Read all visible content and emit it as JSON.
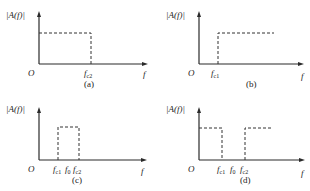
{
  "diagram": {
    "y_axis_label": "|A(f)|",
    "x_axis_label": "f",
    "origin_label": "O",
    "panels": [
      {
        "id": "a",
        "caption": "(a)",
        "type": "low-pass",
        "freq_labels": [
          {
            "main": "f",
            "sub": "c2"
          }
        ]
      },
      {
        "id": "b",
        "caption": "(b)",
        "type": "high-pass",
        "freq_labels": [
          {
            "main": "f",
            "sub": "c1"
          }
        ]
      },
      {
        "id": "c",
        "caption": "(c)",
        "type": "band-pass",
        "freq_labels": [
          {
            "main": "f",
            "sub": "c1"
          },
          {
            "main": "f",
            "sub": "0"
          },
          {
            "main": "f",
            "sub": "c2"
          }
        ]
      },
      {
        "id": "d",
        "caption": "(d)",
        "type": "band-stop",
        "freq_labels": [
          {
            "main": "f",
            "sub": "c1"
          },
          {
            "main": "f",
            "sub": "0"
          },
          {
            "main": "f",
            "sub": "c2"
          }
        ]
      }
    ]
  }
}
